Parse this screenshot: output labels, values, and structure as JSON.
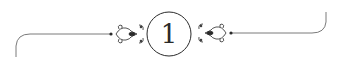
{
  "ornament": {
    "chapter_number": "1",
    "line_color": "#7a7a7a",
    "ink_color": "#2a2a2a"
  }
}
